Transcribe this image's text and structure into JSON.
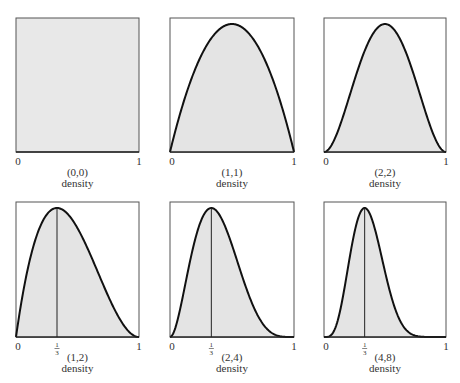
{
  "chart_data": [
    {
      "type": "area",
      "panel": 1,
      "params": "(0,0)",
      "xlabel": "density",
      "x_ticks": [
        "0",
        "1"
      ],
      "shape": "uniform",
      "mode": null,
      "xlim": [
        0,
        1
      ]
    },
    {
      "type": "area",
      "panel": 2,
      "params": "(1,1)",
      "xlabel": "density",
      "x_ticks": [
        "0",
        "1"
      ],
      "shape": "x^1(1-x)^1",
      "mode": 0.5,
      "xlim": [
        0,
        1
      ]
    },
    {
      "type": "area",
      "panel": 3,
      "params": "(2,2)",
      "xlabel": "density",
      "x_ticks": [
        "0",
        "1"
      ],
      "shape": "x^2(1-x)^2",
      "mode": 0.5,
      "xlim": [
        0,
        1
      ]
    },
    {
      "type": "area",
      "panel": 4,
      "params": "(1,2)",
      "xlabel": "density",
      "x_ticks": [
        "0",
        "1/3",
        "1"
      ],
      "shape": "x^1(1-x)^2",
      "mode": 0.3333,
      "xlim": [
        0,
        1
      ]
    },
    {
      "type": "area",
      "panel": 5,
      "params": "(2,4)",
      "xlabel": "density",
      "x_ticks": [
        "0",
        "1/3",
        "1"
      ],
      "shape": "x^2(1-x)^4",
      "mode": 0.3333,
      "xlim": [
        0,
        1
      ]
    },
    {
      "type": "area",
      "panel": 6,
      "params": "(4,8)",
      "xlabel": "density",
      "x_ticks": [
        "0",
        "1/3",
        "1"
      ],
      "shape": "x^4(1-x)^8",
      "mode": 0.3333,
      "xlim": [
        0,
        1
      ]
    }
  ],
  "panels": [
    {
      "a": 0,
      "b": 0,
      "label": "(0,0)",
      "sub": "density",
      "tick0": "0",
      "tick1": "1",
      "mode_tick": null
    },
    {
      "a": 1,
      "b": 1,
      "label": "(1,1)",
      "sub": "density",
      "tick0": "0",
      "tick1": "1",
      "mode_tick": null
    },
    {
      "a": 2,
      "b": 2,
      "label": "(2,2)",
      "sub": "density",
      "tick0": "0",
      "tick1": "1",
      "mode_tick": null
    },
    {
      "a": 1,
      "b": 2,
      "label": "(1,2)",
      "sub": "density",
      "tick0": "0",
      "tick1": "1",
      "mode_tick": {
        "num": "1",
        "den": "3"
      }
    },
    {
      "a": 2,
      "b": 4,
      "label": "(2,4)",
      "sub": "density",
      "tick0": "0",
      "tick1": "1",
      "mode_tick": {
        "num": "1",
        "den": "3"
      }
    },
    {
      "a": 4,
      "b": 8,
      "label": "(4,8)",
      "sub": "density",
      "tick0": "0",
      "tick1": "1",
      "mode_tick": {
        "num": "1",
        "den": "3"
      }
    }
  ]
}
